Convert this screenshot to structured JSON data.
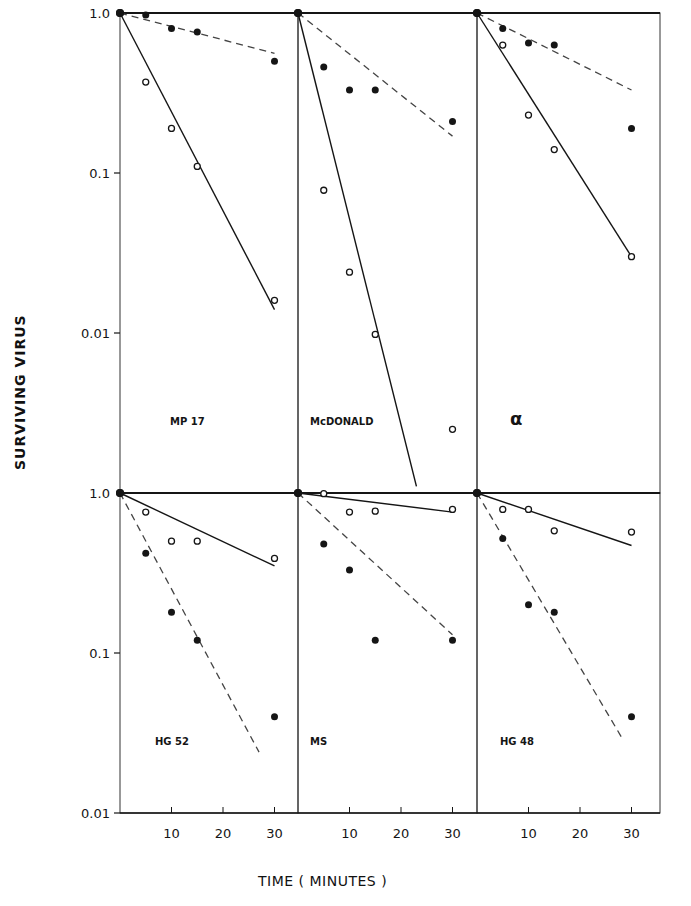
{
  "figure": {
    "y_axis_label": "SURVIVING  VIRUS",
    "x_axis_label": "TIME ( MINUTES )",
    "y_ticks": [
      "1.0",
      "0.1",
      "0.01"
    ],
    "x_ticks": [
      "10",
      "20",
      "30"
    ]
  },
  "chart_data": {
    "type": "scatter",
    "scale": {
      "y": "log",
      "x": "linear"
    },
    "xlabel": "TIME (MINUTES)",
    "ylabel": "SURVIVING VIRUS",
    "ylim": [
      0.01,
      1.0
    ],
    "xlim": [
      0,
      35
    ],
    "x_ticks": [
      10,
      20,
      30
    ],
    "y_ticks": [
      1.0,
      0.1,
      0.01
    ],
    "legend": "filled circles with dashed fit line; open circles with solid fit line",
    "panels": [
      {
        "label": "MP 17",
        "row": 0,
        "col": 0,
        "series": [
          {
            "name": "filled",
            "marker": "filled-circle",
            "line": "dashed",
            "x": [
              0,
              5,
              10,
              15,
              30
            ],
            "y": [
              1.0,
              0.97,
              0.8,
              0.76,
              0.5
            ],
            "fit": {
              "x": [
                0,
                30
              ],
              "y": [
                1.0,
                0.56
              ]
            }
          },
          {
            "name": "open",
            "marker": "open-circle",
            "line": "solid",
            "x": [
              0,
              5,
              10,
              15,
              30
            ],
            "y": [
              1.0,
              0.37,
              0.19,
              0.11,
              0.016
            ],
            "fit": {
              "x": [
                0,
                30
              ],
              "y": [
                1.0,
                0.014
              ]
            }
          }
        ]
      },
      {
        "label": "McDONALD",
        "row": 0,
        "col": 1,
        "series": [
          {
            "name": "filled",
            "marker": "filled-circle",
            "line": "dashed",
            "x": [
              0,
              5,
              10,
              15,
              30
            ],
            "y": [
              1.0,
              0.46,
              0.33,
              0.33,
              0.21
            ],
            "fit": {
              "x": [
                0,
                30
              ],
              "y": [
                1.0,
                0.17
              ]
            }
          },
          {
            "name": "open",
            "marker": "open-circle",
            "line": "solid",
            "x": [
              0,
              5,
              10,
              15,
              30
            ],
            "y": [
              1.0,
              0.078,
              0.024,
              0.0098,
              0.0025
            ],
            "fit": {
              "x": [
                0,
                23
              ],
              "y": [
                1.0,
                0.0011
              ]
            }
          }
        ]
      },
      {
        "label": "α",
        "row": 0,
        "col": 2,
        "series": [
          {
            "name": "filled",
            "marker": "filled-circle",
            "line": "dashed",
            "x": [
              0,
              5,
              10,
              15,
              30
            ],
            "y": [
              1.0,
              0.8,
              0.65,
              0.63,
              0.19
            ],
            "fit": {
              "x": [
                0,
                30
              ],
              "y": [
                1.0,
                0.33
              ]
            }
          },
          {
            "name": "open",
            "marker": "open-circle",
            "line": "solid",
            "x": [
              0,
              5,
              10,
              15,
              30
            ],
            "y": [
              1.0,
              0.63,
              0.23,
              0.14,
              0.03
            ],
            "fit": {
              "x": [
                0,
                30
              ],
              "y": [
                1.0,
                0.03
              ]
            }
          }
        ]
      },
      {
        "label": "HG 52",
        "row": 1,
        "col": 0,
        "series": [
          {
            "name": "open",
            "marker": "open-circle",
            "line": "solid",
            "x": [
              0,
              5,
              10,
              15,
              30
            ],
            "y": [
              1.0,
              0.76,
              0.5,
              0.5,
              0.39
            ],
            "fit": {
              "x": [
                0,
                30
              ],
              "y": [
                1.0,
                0.35
              ]
            }
          },
          {
            "name": "filled",
            "marker": "filled-circle",
            "line": "dashed",
            "x": [
              0,
              5,
              10,
              15,
              30
            ],
            "y": [
              1.0,
              0.42,
              0.18,
              0.12,
              0.04
            ],
            "fit": {
              "x": [
                0,
                27
              ],
              "y": [
                1.0,
                0.024
              ]
            }
          }
        ]
      },
      {
        "label": "MS",
        "row": 1,
        "col": 1,
        "series": [
          {
            "name": "open",
            "marker": "open-circle",
            "line": "solid",
            "x": [
              0,
              5,
              10,
              15,
              30
            ],
            "y": [
              1.0,
              0.99,
              0.76,
              0.77,
              0.79
            ],
            "fit": {
              "x": [
                0,
                30
              ],
              "y": [
                1.0,
                0.76
              ]
            }
          },
          {
            "name": "filled",
            "marker": "filled-circle",
            "line": "dashed",
            "x": [
              0,
              5,
              10,
              15,
              30
            ],
            "y": [
              1.0,
              0.48,
              0.33,
              0.12,
              0.12
            ],
            "fit": {
              "x": [
                0,
                30
              ],
              "y": [
                1.0,
                0.13
              ]
            }
          }
        ]
      },
      {
        "label": "HG 48",
        "row": 1,
        "col": 2,
        "series": [
          {
            "name": "open",
            "marker": "open-circle",
            "line": "solid",
            "x": [
              0,
              5,
              10,
              15,
              30
            ],
            "y": [
              1.0,
              0.79,
              0.79,
              0.58,
              0.57
            ],
            "fit": {
              "x": [
                0,
                30
              ],
              "y": [
                1.0,
                0.47
              ]
            }
          },
          {
            "name": "filled",
            "marker": "filled-circle",
            "line": "dashed",
            "x": [
              0,
              5,
              10,
              15,
              30
            ],
            "y": [
              1.0,
              0.52,
              0.2,
              0.18,
              0.04
            ],
            "fit": {
              "x": [
                0,
                28
              ],
              "y": [
                1.0,
                0.03
              ]
            }
          }
        ]
      }
    ]
  }
}
